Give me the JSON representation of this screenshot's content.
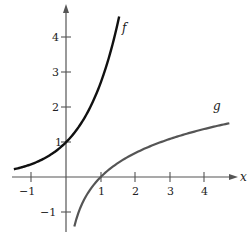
{
  "chart_data": {
    "type": "line",
    "title": "",
    "xlabel": "x",
    "ylabel": "",
    "xlim": [
      -1.5,
      4.9
    ],
    "ylim": [
      -1.45,
      4.9
    ],
    "grid": false,
    "legend": "none (curves labeled inline)",
    "x_ticks": [
      -1,
      1,
      2,
      3,
      4
    ],
    "x_tick_labels": [
      "−1",
      "1",
      "2",
      "3",
      "4"
    ],
    "y_ticks": [
      -1,
      1,
      2,
      3,
      4
    ],
    "y_tick_labels": [
      "−1",
      "1",
      "2",
      "3",
      "4"
    ],
    "series": [
      {
        "name": "f",
        "function": "e^x",
        "color": "#111111",
        "domain": [
          -1.5,
          1.53
        ],
        "x": [
          -1.5,
          -1,
          -0.5,
          0,
          0.5,
          1,
          1.25,
          1.53
        ],
        "y": [
          0.22,
          0.37,
          0.61,
          1.0,
          1.65,
          2.72,
          3.49,
          4.62
        ]
      },
      {
        "name": "g",
        "function": "ln x",
        "color": "#555555",
        "domain": [
          0.24,
          4.7
        ],
        "x": [
          0.24,
          0.5,
          1,
          2,
          3,
          4,
          4.7
        ],
        "y": [
          -1.43,
          -0.69,
          0,
          0.69,
          1.1,
          1.39,
          1.55
        ]
      }
    ],
    "annotations": [
      {
        "text": "f",
        "x": 1.7,
        "y": 4.2
      },
      {
        "text": "g",
        "x": 4.4,
        "y": 1.95
      }
    ]
  },
  "labels": {
    "x_axis": "x",
    "f": "f",
    "g": "g",
    "ticks": {
      "xm1": "−1",
      "x1": "1",
      "x2": "2",
      "x3": "3",
      "x4": "4",
      "y1": "1",
      "y2": "2",
      "y3": "3",
      "y4": "4",
      "ym1": "−1"
    }
  }
}
